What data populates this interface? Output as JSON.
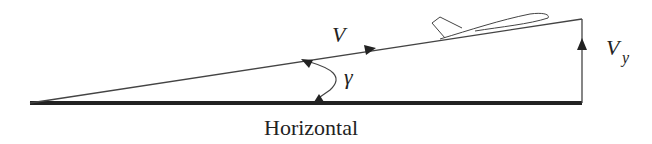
{
  "diagram": {
    "labels": {
      "velocity": "V",
      "vertical_velocity_main": "V",
      "vertical_velocity_sub": "y",
      "angle": "γ",
      "baseline": "Horizontal"
    },
    "colors": {
      "stroke": "#222222",
      "background": "#ffffff"
    }
  }
}
